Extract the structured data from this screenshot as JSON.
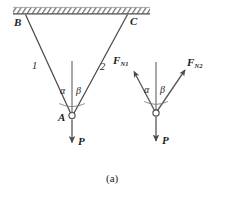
{
  "figure": {
    "caption": "(a)",
    "support": {
      "name": "hatched-ceiling",
      "hatch_color": "#6f6f6f"
    },
    "left_diagram": {
      "name": "two-bar-truss",
      "nodes": [
        {
          "id": "B",
          "label": "B",
          "x": 24,
          "y": 15
        },
        {
          "id": "C",
          "label": "C",
          "x": 128,
          "y": 14
        },
        {
          "id": "A",
          "label": "A",
          "x": 72,
          "y": 116
        }
      ],
      "members": [
        {
          "label": "1",
          "from": "B",
          "to": "A"
        },
        {
          "label": "2",
          "from": "C",
          "to": "A"
        }
      ],
      "angles": [
        {
          "label": "α",
          "between": "member-1 and vertical"
        },
        {
          "label": "β",
          "between": "vertical and member-2"
        }
      ],
      "load": {
        "label": "P",
        "direction": "down"
      }
    },
    "right_diagram": {
      "name": "free-body-diagram",
      "joint": {
        "x": 156,
        "y": 113
      },
      "forces": [
        {
          "label": "F",
          "sub": "N1",
          "direction": "up-left"
        },
        {
          "label": "F",
          "sub": "N2",
          "direction": "up-right"
        },
        {
          "label": "P",
          "sub": "",
          "direction": "down"
        }
      ],
      "angles": [
        {
          "label": "α"
        },
        {
          "label": "β"
        }
      ]
    },
    "colors": {
      "line": "#4a4a4a",
      "guide": "#8d8d8d",
      "text": "#1d1d1d",
      "background": "#ffffff"
    }
  }
}
